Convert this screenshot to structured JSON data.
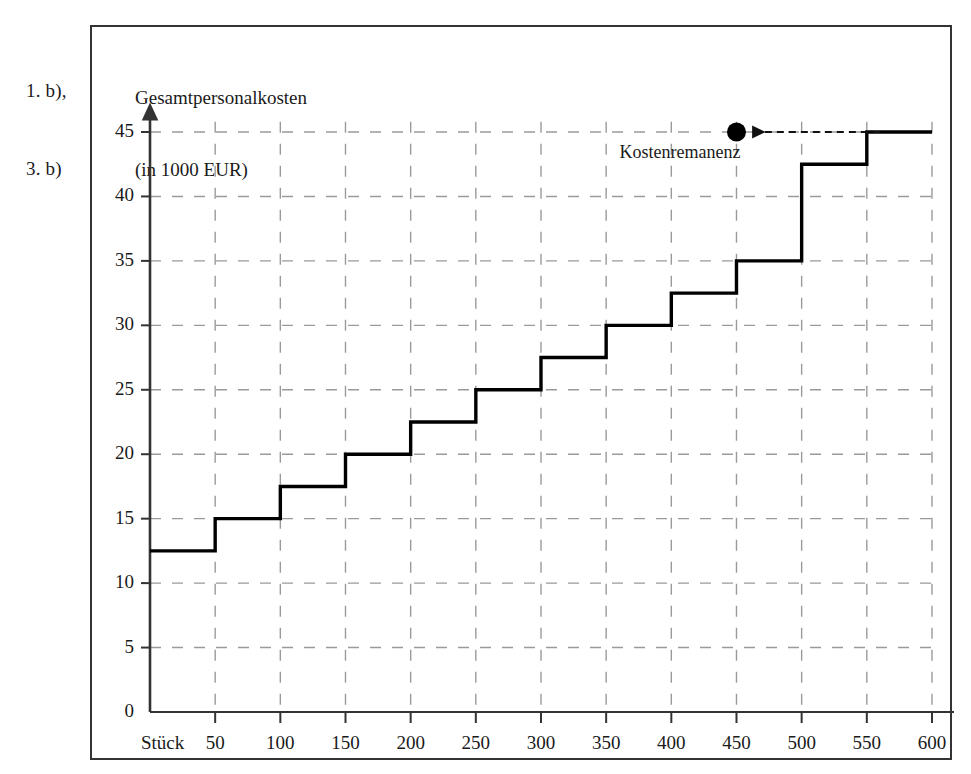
{
  "exercise_ref": {
    "line1": "1. b),",
    "line2": "3. b)"
  },
  "axis_title": {
    "line1": "Gesamtpersonalkosten",
    "line2": "(in 1000 EUR)"
  },
  "x_unit_label": "Stück",
  "annotation": {
    "label": "Kostenremanenz",
    "marker": "filled-dot",
    "arrow": "dashed-left-arrow"
  },
  "colors": {
    "line": "#000000",
    "grid": "#9a9a9a",
    "axis": "#333333",
    "frame": "#333333",
    "text": "#1a1a1a",
    "background": "#ffffff"
  },
  "chart_data": {
    "type": "line",
    "subtype": "step",
    "title": "",
    "xlabel": "Stück",
    "ylabel": "Gesamtpersonalkosten (in 1000 EUR)",
    "xlim": [
      0,
      620
    ],
    "ylim": [
      0,
      47
    ],
    "grid": true,
    "grid_style": "dashed",
    "legend": "none",
    "x_ticks": [
      50,
      100,
      150,
      200,
      250,
      300,
      350,
      400,
      450,
      500,
      550,
      600
    ],
    "x_tick_labels": [
      "50",
      "100",
      "150",
      "200",
      "250",
      "300",
      "350",
      "400",
      "450",
      "500",
      "550",
      "600"
    ],
    "y_ticks": [
      0,
      5,
      10,
      15,
      20,
      25,
      30,
      35,
      40,
      45
    ],
    "y_tick_labels": [
      "0",
      "5",
      "10",
      "15",
      "20",
      "25",
      "30",
      "35",
      "40",
      "45"
    ],
    "series": [
      {
        "name": "Gesamtpersonalkosten",
        "step_segments": [
          {
            "x_start": 0,
            "x_end": 50,
            "y": 12.5
          },
          {
            "x_start": 50,
            "x_end": 100,
            "y": 15
          },
          {
            "x_start": 100,
            "x_end": 150,
            "y": 17.5
          },
          {
            "x_start": 150,
            "x_end": 200,
            "y": 20
          },
          {
            "x_start": 200,
            "x_end": 250,
            "y": 22.5
          },
          {
            "x_start": 250,
            "x_end": 300,
            "y": 25
          },
          {
            "x_start": 300,
            "x_end": 350,
            "y": 27.5
          },
          {
            "x_start": 350,
            "x_end": 400,
            "y": 30
          },
          {
            "x_start": 400,
            "x_end": 450,
            "y": 32.5
          },
          {
            "x_start": 450,
            "x_end": 500,
            "y": 35
          },
          {
            "x_start": 500,
            "x_end": 550,
            "y": 42.5
          },
          {
            "x_start": 550,
            "x_end": 600,
            "y": 45
          }
        ]
      }
    ],
    "annotations": [
      {
        "text": "Kostenremanenz",
        "marker_x": 450,
        "marker_y": 45,
        "arrow_from_x": 560,
        "arrow_to_x": 462,
        "arrow_y": 45
      }
    ]
  }
}
